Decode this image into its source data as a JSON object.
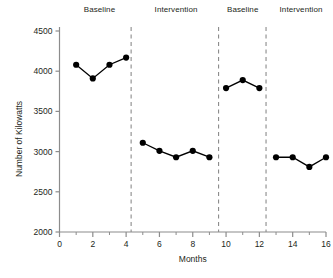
{
  "chart_data": {
    "type": "line",
    "title": "",
    "xlabel": "Months",
    "ylabel": "Number of Kilowatts",
    "xlim": [
      0,
      16
    ],
    "ylim": [
      2000,
      4500
    ],
    "xticks": [
      0,
      2,
      4,
      6,
      8,
      10,
      12,
      14,
      16
    ],
    "xtick_labels": [
      "0",
      "2",
      "4",
      "6",
      "8",
      "10",
      "12",
      "14",
      "16"
    ],
    "xminorticks": [
      1,
      3,
      5,
      7,
      9,
      11,
      13,
      15
    ],
    "yticks": [
      2000,
      2500,
      3000,
      3500,
      4000,
      4500
    ],
    "ytick_labels": [
      "2000",
      "2500",
      "3000",
      "3500",
      "4000",
      "4500"
    ],
    "grid": false,
    "legend": "none",
    "marker": "filled-circle",
    "line_color": "#000000",
    "marker_color": "#000000",
    "phase_divider_color": "#8c8c8c",
    "phase_dividers": [
      4.3,
      9.55,
      12.4
    ],
    "phases": [
      {
        "label": "Baseline",
        "label_x": 2.4,
        "x": [
          1,
          2,
          3,
          4
        ],
        "y": [
          4080,
          3910,
          4080,
          4170
        ]
      },
      {
        "label": "Intervention",
        "label_x": 7.0,
        "x": [
          5,
          6,
          7,
          8,
          9
        ],
        "y": [
          3110,
          3010,
          2930,
          3010,
          2930
        ]
      },
      {
        "label": "Baseline",
        "label_x": 11.0,
        "x": [
          10,
          11,
          12
        ],
        "y": [
          3790,
          3890,
          3790
        ]
      },
      {
        "label": "Intervention",
        "label_x": 14.5,
        "x": [
          13,
          14,
          15,
          16
        ],
        "y": [
          2930,
          2930,
          2810,
          2930
        ]
      }
    ]
  }
}
